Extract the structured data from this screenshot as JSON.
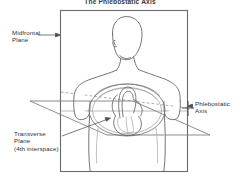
{
  "figure": {
    "title": "The Phlebostatic Axis",
    "background_color": "#ffffff",
    "line_color": "#555555",
    "text_color": "#303030",
    "labels": {
      "midfrontal_line1": "Midfrontal",
      "midfrontal_line2": "Plane",
      "transverse_line1": "Transverse",
      "transverse_line2": "Plane",
      "transverse_line3": "(4th interspace)",
      "phlebostatic_line1": "Phlebostatic",
      "phlebostatic_line2": "Axis"
    },
    "icons": {
      "torso": "human-torso-icon",
      "heart": "heart-icon",
      "midfrontal_plane": "vertical-plane-icon",
      "transverse_plane": "horizontal-plane-icon",
      "axis_marker": "crosshair-icon"
    }
  }
}
